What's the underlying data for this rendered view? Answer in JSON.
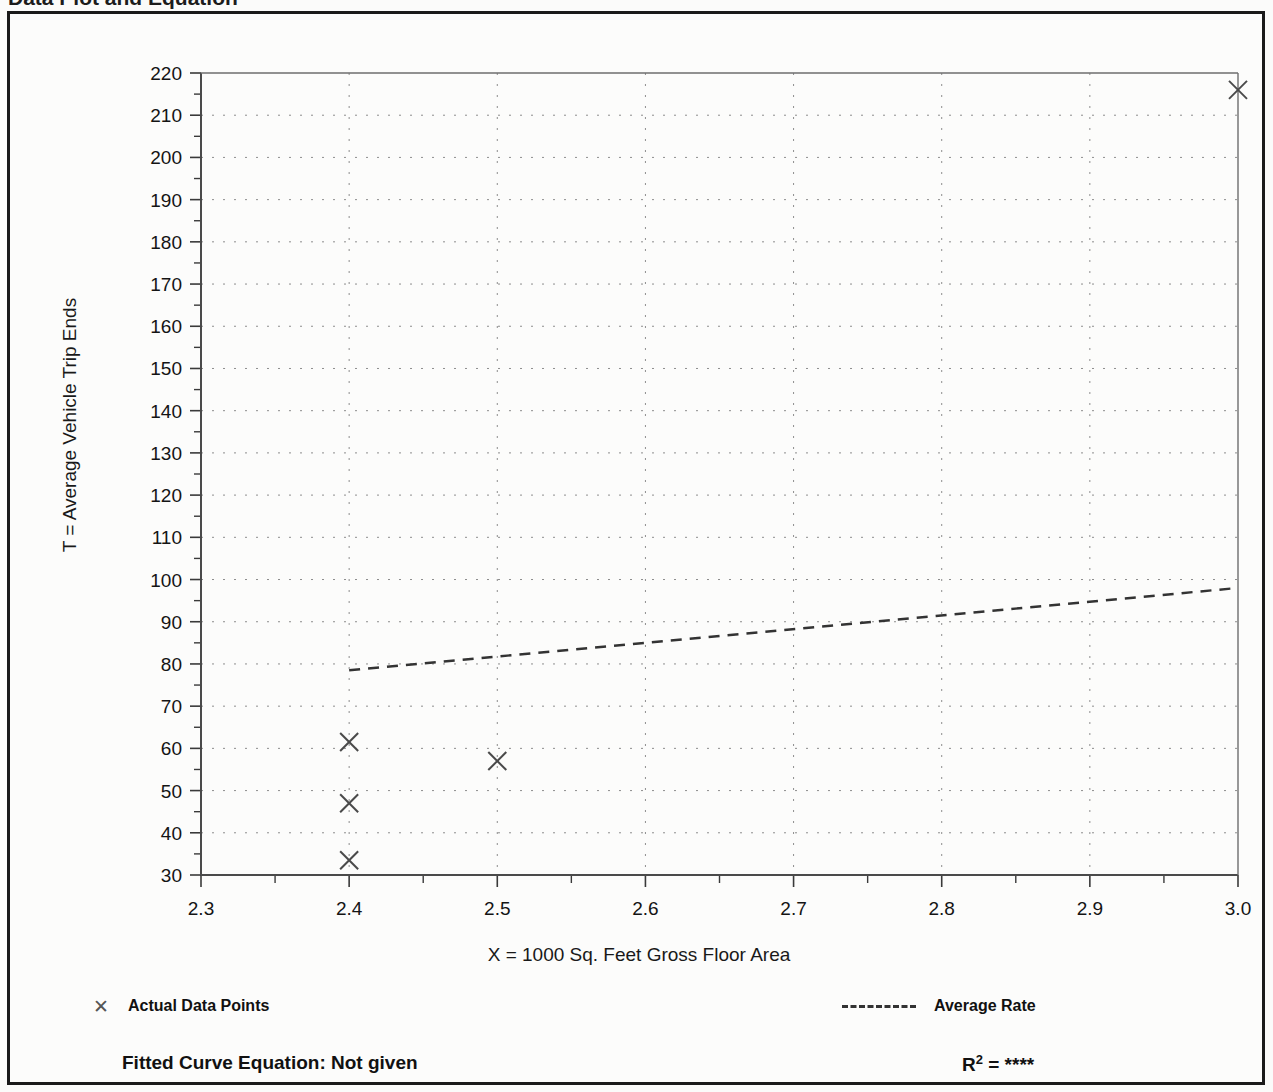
{
  "header": {
    "left_title": "Data Plot and Equation",
    "right_title": ""
  },
  "legend": {
    "data_points_label": "Actual Data Points",
    "data_points_marker": "x-marker-icon",
    "average_rate_label": "Average Rate",
    "average_rate_marker": "dashed-line-icon"
  },
  "equation": {
    "fitted_label": "Fitted Curve Equation:  Not given",
    "r_squared_prefix": "R",
    "r_squared_exponent": "2",
    "r_squared_value": "= ****"
  },
  "chart_data": {
    "type": "scatter",
    "title": "Data Plot and Equation",
    "xlabel": "X = 1000 Sq. Feet Gross Floor Area",
    "ylabel": "T = Average Vehicle Trip Ends",
    "xlim": [
      2.3,
      3.0
    ],
    "ylim": [
      30,
      220
    ],
    "xticks": [
      "2.3",
      "2.4",
      "2.5",
      "2.6",
      "2.7",
      "2.8",
      "2.9",
      "3.0"
    ],
    "yticks": [
      "30",
      "40",
      "50",
      "60",
      "70",
      "80",
      "90",
      "100",
      "110",
      "120",
      "130",
      "140",
      "150",
      "160",
      "170",
      "180",
      "190",
      "200",
      "210",
      "220"
    ],
    "grid": "dotted",
    "legend_position": "below-plot",
    "series": [
      {
        "name": "Actual Data Points",
        "marker": "x",
        "color": "#4a4a4a",
        "points": [
          {
            "x": 2.4,
            "y": 61.5
          },
          {
            "x": 2.4,
            "y": 47.0
          },
          {
            "x": 2.4,
            "y": 33.5
          },
          {
            "x": 2.5,
            "y": 57.0
          },
          {
            "x": 3.0,
            "y": 216.0
          }
        ]
      },
      {
        "name": "Average Rate",
        "style": "dashed",
        "color": "#333333",
        "line": [
          {
            "x": 2.4,
            "y": 78.5
          },
          {
            "x": 3.0,
            "y": 98.0
          }
        ]
      }
    ]
  }
}
